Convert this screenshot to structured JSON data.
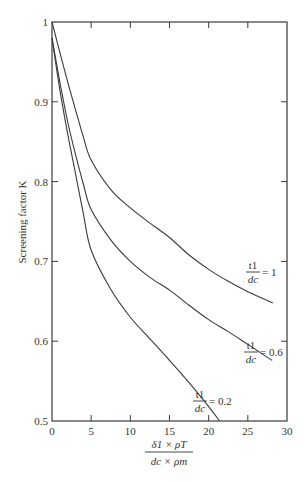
{
  "chart_data": {
    "type": "line",
    "title": "",
    "ylabel": "Screening factor K",
    "xlabel": {
      "numerator": "δ1 × ρT",
      "denominator": "dc × ρm"
    },
    "xlim": [
      0,
      30
    ],
    "ylim": [
      0.5,
      1.0
    ],
    "xticks": [
      0,
      5,
      10,
      15,
      20,
      25,
      30
    ],
    "xtick_labels": [
      "0",
      "5",
      "10",
      "15",
      "20",
      "25",
      "30"
    ],
    "yticks": [
      0.5,
      0.6,
      0.7,
      0.8,
      0.9,
      1.0
    ],
    "ytick_labels": [
      "0.5",
      "0.6",
      "0.7",
      "0.8",
      "0.9",
      "1"
    ],
    "grid": false,
    "series": [
      {
        "name": "t1/dc = 1",
        "label_num": "t1",
        "label_den": "dc",
        "label_value": "= 1",
        "x": [
          0,
          1,
          2,
          3,
          4,
          5,
          7.5,
          10,
          12.5,
          15,
          17.5,
          20,
          22.5,
          25,
          28.2
        ],
        "y": [
          1.0,
          0.962,
          0.925,
          0.89,
          0.856,
          0.827,
          0.79,
          0.767,
          0.748,
          0.73,
          0.708,
          0.69,
          0.675,
          0.662,
          0.648
        ]
      },
      {
        "name": "t1/dc = 0.6",
        "label_num": "t1",
        "label_den": "dc",
        "label_value": "= 0.6",
        "x": [
          0,
          1,
          2,
          3,
          4,
          5,
          7.5,
          10,
          12.5,
          15,
          17.5,
          20,
          22.5,
          25,
          28.1
        ],
        "y": [
          0.98,
          0.925,
          0.875,
          0.834,
          0.797,
          0.765,
          0.727,
          0.7,
          0.68,
          0.664,
          0.645,
          0.627,
          0.612,
          0.596,
          0.576
        ]
      },
      {
        "name": "t1/dc = 0.2",
        "label_num": "t1",
        "label_den": "dc",
        "label_value": "= 0.2",
        "x": [
          0,
          1,
          2,
          3,
          4,
          5,
          7.5,
          10,
          12.5,
          15,
          17.5,
          20,
          21.4
        ],
        "y": [
          0.98,
          0.915,
          0.86,
          0.81,
          0.76,
          0.714,
          0.665,
          0.63,
          0.603,
          0.576,
          0.548,
          0.518,
          0.5
        ]
      }
    ]
  }
}
